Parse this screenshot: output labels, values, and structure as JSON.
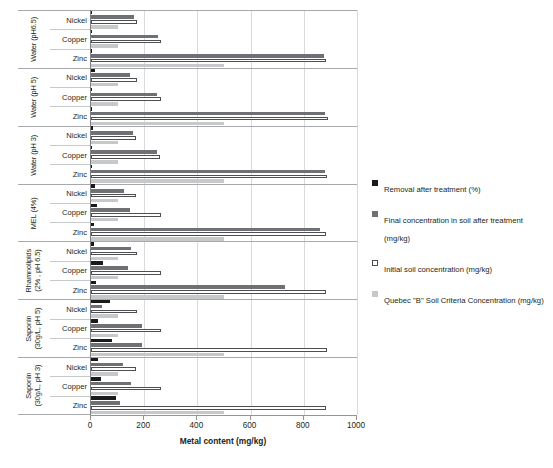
{
  "chart_data": {
    "type": "bar",
    "orientation": "horizontal",
    "title": "",
    "xlabel": "Metal content (mg/kg)",
    "ylabel": "",
    "xlim": [
      0,
      1000
    ],
    "xticks": [
      0,
      200,
      400,
      600,
      800,
      1000
    ],
    "grid": "vertical",
    "legend_position": "right",
    "series_names": [
      "Removal after treatment (%)",
      "Final  concentration in soil after treatment (mg/kg)",
      "Initial soil concentration (mg/kg)",
      "Quebec \"B\" Soil Criteria Concentration (mg/kg)"
    ],
    "metals": [
      "Nickel",
      "Copper",
      "Zinc"
    ],
    "groups": [
      {
        "label_lines": [
          "Water (pH6.5)"
        ],
        "rows": [
          {
            "metal": "Nickel",
            "removal": 5,
            "final": 160,
            "initial": 172,
            "quebec": 100
          },
          {
            "metal": "Copper",
            "removal": 3,
            "final": 250,
            "initial": 262,
            "quebec": 100
          },
          {
            "metal": "Zinc",
            "removal": 2,
            "final": 875,
            "initial": 885,
            "quebec": 500
          }
        ]
      },
      {
        "label_lines": [
          "Water (pH 5)"
        ],
        "rows": [
          {
            "metal": "Nickel",
            "removal": 14,
            "final": 148,
            "initial": 172,
            "quebec": 100
          },
          {
            "metal": "Copper",
            "removal": 4,
            "final": 248,
            "initial": 262,
            "quebec": 100
          },
          {
            "metal": "Zinc",
            "removal": 3,
            "final": 880,
            "initial": 890,
            "quebec": 500
          }
        ]
      },
      {
        "label_lines": [
          "Water (pH 3)"
        ],
        "rows": [
          {
            "metal": "Nickel",
            "removal": 6,
            "final": 158,
            "initial": 170,
            "quebec": 100
          },
          {
            "metal": "Copper",
            "removal": 4,
            "final": 248,
            "initial": 260,
            "quebec": 100
          },
          {
            "metal": "Zinc",
            "removal": 4,
            "final": 878,
            "initial": 888,
            "quebec": 500
          }
        ]
      },
      {
        "label_lines": [
          "MEL (4%)"
        ],
        "rows": [
          {
            "metal": "Nickel",
            "removal": 14,
            "final": 125,
            "initial": 170,
            "quebec": 100
          },
          {
            "metal": "Copper",
            "removal": 22,
            "final": 148,
            "initial": 262,
            "quebec": 100
          },
          {
            "metal": "Zinc",
            "removal": 12,
            "final": 860,
            "initial": 885,
            "quebec": 500
          }
        ]
      },
      {
        "label_lines": [
          "Rhamnolipids",
          "(2% , pH 6.5)"
        ],
        "rows": [
          {
            "metal": "Nickel",
            "removal": 10,
            "final": 152,
            "initial": 172,
            "quebec": 100
          },
          {
            "metal": "Copper",
            "removal": 45,
            "final": 140,
            "initial": 262,
            "quebec": 100
          },
          {
            "metal": "Zinc",
            "removal": 18,
            "final": 728,
            "initial": 885,
            "quebec": 500
          }
        ]
      },
      {
        "label_lines": [
          "Saponin",
          "(30g/L, pH 5)"
        ],
        "rows": [
          {
            "metal": "Nickel",
            "removal": 72,
            "final": 42,
            "initial": 172,
            "quebec": 100
          },
          {
            "metal": "Copper",
            "removal": 25,
            "final": 190,
            "initial": 262,
            "quebec": 100
          },
          {
            "metal": "Zinc",
            "removal": 80,
            "final": 190,
            "initial": 888,
            "quebec": 500
          }
        ]
      },
      {
        "label_lines": [
          "Saponin",
          "(30g/L, pH 3)"
        ],
        "rows": [
          {
            "metal": "Nickel",
            "removal": 28,
            "final": 122,
            "initial": 170,
            "quebec": 100
          },
          {
            "metal": "Copper",
            "removal": 38,
            "final": 152,
            "initial": 262,
            "quebec": 100
          },
          {
            "metal": "Zinc",
            "removal": 95,
            "final": 110,
            "initial": 885,
            "quebec": 500
          }
        ]
      }
    ]
  },
  "axis": {
    "x_title": "Metal content (mg/kg)",
    "x_tick_labels": [
      "0",
      "200",
      "400",
      "600",
      "800",
      "1000"
    ]
  },
  "legend": {
    "items": [
      {
        "swatch": "sw-removal",
        "text": "Removal after treatment (%)"
      },
      {
        "swatch": "sw-finalc",
        "text": "Final  concentration in soil after treatment (mg/kg)"
      },
      {
        "swatch": "sw-initial",
        "text": "Initial soil concentration (mg/kg)"
      },
      {
        "swatch": "sw-quebec",
        "text": "Quebec \"B\" Soil Criteria Concentration (mg/kg)"
      }
    ]
  },
  "caption": {
    "text": ""
  },
  "colors": {
    "removal": "#1a1a1a",
    "final": "#6e7073",
    "initial_border": "#4d4f53",
    "quebec": "#c6c8ca",
    "grid": "#d9dadb",
    "axis": "#939598"
  }
}
